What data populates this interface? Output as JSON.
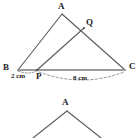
{
  "figure": {
    "title_visible": false,
    "background_color": "#ffffff",
    "stroke_color": "#5a5a5a",
    "baseline_color": "#9a9a9a",
    "text_color": "#1c1c1c",
    "upper_triangle": {
      "name": "triangle-ABC",
      "vertices": [
        {
          "id": "A",
          "label": "A",
          "x": 62,
          "y": 14
        },
        {
          "id": "B",
          "label": "B",
          "x": 18,
          "y": 70
        },
        {
          "id": "C",
          "label": "C",
          "x": 125,
          "y": 70
        }
      ],
      "points_on_sides": [
        {
          "id": "Q",
          "label": "Q",
          "x": 84,
          "y": 28,
          "on_segment": "AC"
        },
        {
          "id": "P",
          "label": "P",
          "x": 37,
          "y": 70,
          "on_segment": "BC"
        }
      ],
      "cevian": {
        "from": "P",
        "to": "Q"
      },
      "measurements": [
        {
          "id": "BP",
          "label": "2 cm",
          "from": "B",
          "to": "P",
          "style": "dashed-arc"
        },
        {
          "id": "PC",
          "label": "8 cm",
          "from": "P",
          "to": "C",
          "style": "dashed-arc"
        }
      ]
    },
    "lower_triangle": {
      "name": "triangle-partial-lower",
      "clipped": true,
      "vertices": [
        {
          "id": "A2",
          "label": "A",
          "x": 67,
          "y": 110
        }
      ],
      "legs": [
        {
          "from_x": 67,
          "from_y": 110,
          "to_x": 33,
          "to_y": 138
        },
        {
          "from_x": 67,
          "from_y": 110,
          "to_x": 101,
          "to_y": 138
        }
      ]
    }
  }
}
